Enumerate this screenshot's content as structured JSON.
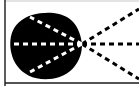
{
  "figure": {
    "kind": "line-diagram",
    "width": 139,
    "height": 86,
    "background_color": "#FFFFFF",
    "ink_color": "#000000",
    "dash_light_color": "#FFFFFF",
    "frame": {
      "left_rule": {
        "x": 5.0,
        "y1": 0,
        "y2": 86,
        "width": 1.4,
        "color": "#1A1A1A"
      },
      "bottom_rule": {
        "y": 83.0,
        "x1": 5.0,
        "x2": 139,
        "width": 1.4,
        "color": "#1A1A1A"
      },
      "top_rule": {
        "y": 1.0,
        "x1": 5.0,
        "x2": 139,
        "width": 1.0,
        "color": "#C8C8C8"
      }
    },
    "blob": {
      "name": "filled-black-blob",
      "fill": "#000000",
      "bounds": {
        "x_min": 10,
        "x_max": 83,
        "y_min": 13,
        "y_max": 79
      },
      "apex": {
        "x": 82,
        "y": 44
      },
      "path": "M 82.0 44.0 C 80.5 32.5 76.5 23.5 68.5 18.0 C 61.0 12.8 50.0 11.8 40.0 13.2 C 29.0 14.8 19.5 19.5 14.5 27.5 C 9.8 35.0 9.4 45.0 11.5 53.8 C 13.8 63.0 19.5 71.0 28.5 75.5 C 37.5 80.0 49.5 80.3 59.5 77.0 C 69.5 73.7 77.0 66.0 80.4 55.5 C 81.6 51.8 82.0 47.8 82.0 44.0 Z"
    },
    "rays": {
      "origin": {
        "x": 82,
        "y": 44
      },
      "inner_dashes": {
        "color": "#FFFFFF",
        "width": 3.0,
        "dash": "5 4"
      },
      "outer_dashes": {
        "color": "#000000",
        "width": 3.0,
        "dash": "5 4"
      },
      "items": [
        {
          "id": "ray-axis-left",
          "label": "horizontal axis ray (inside blob)",
          "direction": "left",
          "side": "inner",
          "x2": 6,
          "y2": 44
        },
        {
          "id": "ray-upper-left",
          "label": "upper-left ray (inside blob)",
          "direction": "upper-left",
          "side": "inner",
          "x2": 30,
          "y2": 17
        },
        {
          "id": "ray-lower-left",
          "label": "lower-left ray (inside blob)",
          "direction": "lower-left",
          "side": "inner",
          "x2": 30,
          "y2": 72
        },
        {
          "id": "ray-axis-right",
          "label": "horizontal axis ray (outside)",
          "direction": "right",
          "side": "outer",
          "x2": 139,
          "y2": 44
        },
        {
          "id": "ray-upper-right",
          "label": "upper-right ray (outside)",
          "direction": "upper-right",
          "side": "outer",
          "x2": 139,
          "y2": 9
        },
        {
          "id": "ray-lower-right",
          "label": "lower-right ray (outside)",
          "direction": "lower-right",
          "side": "outer",
          "x2": 139,
          "y2": 79
        }
      ]
    }
  }
}
